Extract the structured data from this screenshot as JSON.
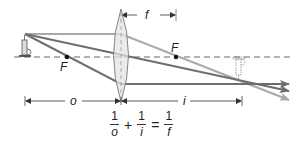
{
  "diagram": {
    "type": "thin-lens-ray-diagram",
    "labels": {
      "focal_length": "f",
      "focal_point_left": "F",
      "focal_point_right": "F",
      "object_distance": "o",
      "image_distance": "i"
    },
    "equation": {
      "terms": [
        {
          "numerator": "1",
          "denominator": "o"
        },
        {
          "numerator": "1",
          "denominator": "i"
        },
        {
          "numerator": "1",
          "denominator": "f"
        }
      ],
      "operators": [
        "+",
        "="
      ]
    },
    "elements": {
      "object": "candle (upright, real object)",
      "lens": "converging (biconvex) lens",
      "image": "candle (inverted, real image, dashed outline)",
      "optical_axis": "dashed horizontal line"
    },
    "colors": {
      "ray_dark": "#6e6e6e",
      "ray_light": "#a9a9a9",
      "lens_fill": "#e4e4e4",
      "lens_stroke": "#7a7a7a",
      "axis": "#555555",
      "text": "#222222"
    }
  }
}
